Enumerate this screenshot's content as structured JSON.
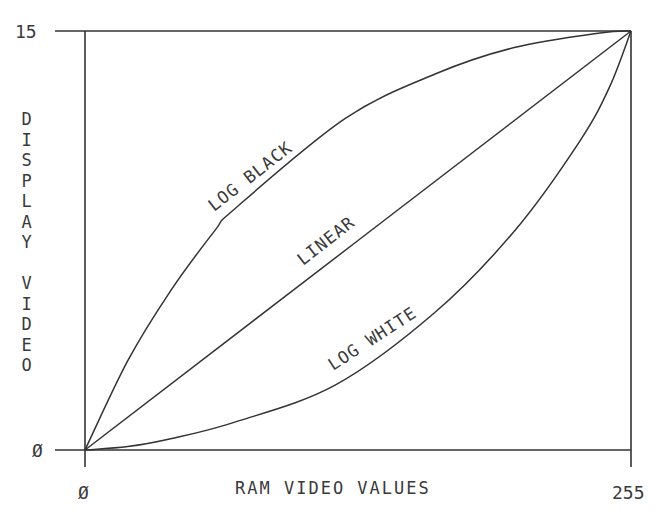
{
  "chart_data": {
    "type": "line",
    "title": "",
    "xlabel": "RAM VIDEO VALUES",
    "ylabel": "DISPLAY VIDEO",
    "xlim": [
      0,
      255
    ],
    "ylim": [
      0,
      15
    ],
    "x_ticks": [
      "0",
      "255"
    ],
    "y_ticks": [
      "0",
      "15"
    ],
    "grid": false,
    "legend": "inline curve labels",
    "series": [
      {
        "name": "LOG BLACK",
        "x": [
          0,
          20,
          40,
          60.7,
          70,
          121.4,
          163.5,
          200,
          240.5,
          255
        ],
        "y": [
          0,
          3.2,
          5.7,
          7.86,
          8.64,
          11.86,
          13.46,
          14.4,
          14.93,
          15
        ]
      },
      {
        "name": "LINEAR",
        "x": [
          0,
          255
        ],
        "y": [
          0,
          15
        ]
      },
      {
        "name": "LOG WHITE",
        "x": [
          0,
          20,
          40,
          70,
          116.8,
          163.5,
          200.8,
          231.2,
          245,
          255
        ],
        "y": [
          0,
          0.12,
          0.4,
          1.0,
          2.32,
          4.93,
          7.86,
          11.07,
          13.0,
          15
        ]
      }
    ]
  },
  "labels": {
    "y_tick_max": "15",
    "y_tick_min": "Ø",
    "x_tick_min": "Ø",
    "x_tick_max": "255",
    "x_axis_label": "RAM VIDEO VALUES",
    "y_axis_label_letters": [
      "D",
      "I",
      "S",
      "P",
      "L",
      "A",
      "Y",
      " ",
      "V",
      "I",
      "D",
      "E",
      "O"
    ],
    "curve_log_black": "LOG BLACK",
    "curve_linear": "LINEAR",
    "curve_log_white": "LOG WHITE"
  }
}
